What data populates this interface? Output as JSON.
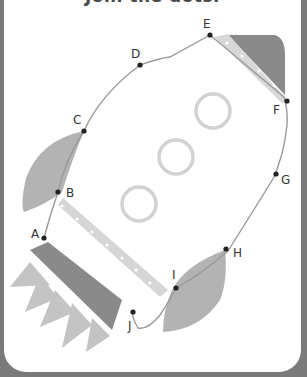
{
  "title": "Join the dots.",
  "colors": {
    "background": "#7a7a7a",
    "card": "#ffffff",
    "dark_fill": "#8a8a8a",
    "mid_fill": "#b0b0b0",
    "light_fill": "#d6d6d6",
    "stripe": "#dcdcdc",
    "line": "#9a9a9a",
    "dot": "#222222"
  },
  "dots": [
    {
      "label": "A"
    },
    {
      "label": "B"
    },
    {
      "label": "C"
    },
    {
      "label": "D"
    },
    {
      "label": "E"
    },
    {
      "label": "F"
    },
    {
      "label": "G"
    },
    {
      "label": "H"
    },
    {
      "label": "I"
    },
    {
      "label": "J"
    }
  ]
}
